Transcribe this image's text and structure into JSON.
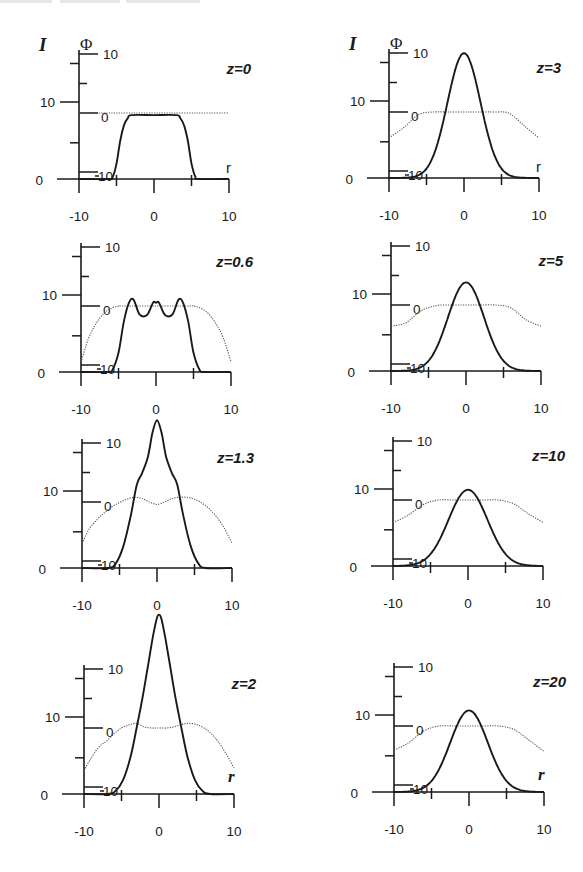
{
  "figure": {
    "header_fragment": "",
    "intensity_symbol": "I",
    "phase_symbol": "Φ",
    "r_symbol": "r"
  },
  "chart_data": [
    {
      "type": "line",
      "title": "z=0",
      "xlabel": "r",
      "ylabel": "I (solid), Φ (dotted)",
      "xlim": [
        -10,
        10
      ],
      "ylim_I": [
        0,
        18
      ],
      "phi_ticks": [
        10,
        0,
        -10
      ],
      "I_ticks": [
        0,
        10
      ],
      "x_ticks": [
        -10,
        0,
        10
      ],
      "series": [
        {
          "name": "I",
          "x": [
            -10,
            -6,
            -5.5,
            -5,
            -4.5,
            -4,
            -3.5,
            -3,
            0,
            3,
            3.5,
            4,
            4.5,
            5,
            5.5,
            6,
            10
          ],
          "values": [
            0,
            0,
            0.3,
            2,
            5,
            7,
            7.9,
            8.3,
            8.3,
            8.3,
            7.9,
            7,
            5,
            2,
            0.3,
            0,
            0
          ]
        },
        {
          "name": "Φ",
          "x": [
            -10,
            10
          ],
          "values": [
            0,
            0
          ]
        }
      ]
    },
    {
      "type": "line",
      "title": "z=3",
      "xlabel": "r",
      "xlim": [
        -10,
        10
      ],
      "phi_ticks": [
        10,
        0,
        -10
      ],
      "I_ticks": [
        0,
        10
      ],
      "x_ticks": [
        -10,
        0,
        10
      ],
      "series": [
        {
          "name": "I",
          "gaussian": {
            "peak": 16.2,
            "center": 0,
            "sigma": 2.2
          }
        },
        {
          "name": "Φ",
          "x": [
            -10,
            -8,
            -6,
            -4,
            -2,
            0,
            2,
            4,
            6,
            8,
            10
          ],
          "values": [
            -4.4,
            -2.6,
            -0.4,
            0,
            0,
            0,
            0,
            0,
            -0.2,
            -2.3,
            -4.4
          ]
        }
      ]
    },
    {
      "type": "line",
      "title": "z=0.6",
      "xlabel": "r",
      "xlim": [
        -10,
        10
      ],
      "phi_ticks": [
        10,
        0,
        -10
      ],
      "I_ticks": [
        0,
        10
      ],
      "x_ticks": [
        -10,
        0,
        10
      ],
      "series": [
        {
          "name": "I",
          "x": [
            -10,
            -6.5,
            -5.8,
            -5,
            -4.3,
            -3.6,
            -3,
            -2.2,
            -1.2,
            -0.4,
            0,
            0.4,
            1.2,
            2.2,
            3,
            3.6,
            4.3,
            5,
            5.8,
            6.5,
            10
          ],
          "values": [
            0,
            0,
            0.3,
            2.5,
            6.5,
            9.0,
            9.4,
            7.5,
            7.4,
            9.0,
            9.0,
            9.0,
            7.4,
            7.5,
            9.4,
            9.0,
            6.5,
            2.5,
            0.3,
            0,
            0
          ]
        },
        {
          "name": "Φ",
          "x": [
            -10,
            -9,
            -8,
            -7,
            -6,
            -5,
            -4,
            4,
            5,
            6,
            7,
            8,
            9,
            10
          ],
          "values": [
            -9.5,
            -5.5,
            -3,
            -1.3,
            -0.4,
            0,
            0,
            0,
            0,
            -0.4,
            -1.3,
            -3,
            -5.5,
            -9.5
          ]
        }
      ]
    },
    {
      "type": "line",
      "title": "z=5",
      "xlabel": "r",
      "xlim": [
        -10,
        10
      ],
      "phi_ticks": [
        10,
        0,
        -10
      ],
      "I_ticks": [
        0,
        10
      ],
      "x_ticks": [
        -10,
        0,
        10
      ],
      "series": [
        {
          "name": "I",
          "gaussian": {
            "peak": 11.5,
            "center": 0,
            "sigma": 2.4
          }
        },
        {
          "name": "Φ",
          "x": [
            -10,
            -8,
            -6,
            -4,
            -2,
            0,
            2,
            4,
            6,
            8,
            10
          ],
          "values": [
            -3.6,
            -3,
            -1,
            -0.1,
            0,
            0,
            0,
            0,
            -0.5,
            -2.5,
            -3.6
          ]
        }
      ]
    },
    {
      "type": "line",
      "title": "z=1.3",
      "xlabel": "r",
      "xlim": [
        -10,
        10
      ],
      "phi_ticks": [
        10,
        0,
        -10
      ],
      "I_ticks": [
        0,
        10
      ],
      "x_ticks": [
        -10,
        0,
        10
      ],
      "series": [
        {
          "name": "I",
          "x": [
            -10,
            -6.5,
            -5.5,
            -4.5,
            -3.5,
            -2.7,
            -2,
            -1.2,
            -0.6,
            0,
            0.6,
            1.2,
            2,
            2.7,
            3.5,
            4.5,
            5.5,
            6.5,
            10
          ],
          "values": [
            0,
            0,
            0.6,
            2.8,
            6.8,
            10.8,
            12.3,
            14.5,
            17.6,
            19.2,
            17.6,
            14.5,
            12.3,
            10.8,
            6.8,
            2.8,
            0.6,
            0,
            0
          ]
        },
        {
          "name": "Φ",
          "x": [
            -10,
            -9,
            -8,
            -7,
            -6,
            -5,
            -4,
            -3,
            -2,
            -1,
            0,
            1,
            2,
            3,
            4,
            5,
            6,
            7,
            8,
            9,
            10
          ],
          "values": [
            -7,
            -4.5,
            -3,
            -1.8,
            -0.8,
            -0.1,
            0.5,
            0.8,
            0.6,
            0,
            -0.4,
            0,
            0.6,
            0.8,
            0.8,
            0.5,
            -0.2,
            -1.2,
            -2.6,
            -4.5,
            -7
          ]
        }
      ]
    },
    {
      "type": "line",
      "title": "z=10",
      "xlabel": "r",
      "xlim": [
        -10,
        10
      ],
      "phi_ticks": [
        10,
        0,
        -10
      ],
      "I_ticks": [
        0,
        10
      ],
      "x_ticks": [
        -10,
        0,
        10
      ],
      "series": [
        {
          "name": "I",
          "gaussian": {
            "peak": 9.9,
            "center": 0,
            "sigma": 2.6
          }
        },
        {
          "name": "Φ",
          "x": [
            -10,
            -8,
            -6,
            -4,
            -2,
            0,
            2,
            4,
            6,
            8,
            10
          ],
          "values": [
            -3.8,
            -2.6,
            -0.8,
            0,
            0,
            0,
            0,
            0,
            -0.6,
            -2.3,
            -3.8
          ]
        }
      ]
    },
    {
      "type": "line",
      "title": "z=2",
      "xlabel": "r",
      "xlim": [
        -10,
        10
      ],
      "phi_ticks": [
        10,
        0,
        -10
      ],
      "I_ticks": [
        0,
        10
      ],
      "x_ticks": [
        -10,
        0,
        10
      ],
      "series": [
        {
          "name": "I",
          "x": [
            -10,
            -6.8,
            -5.8,
            -4.8,
            -3.8,
            -3,
            -2.2,
            -1.5,
            -0.8,
            -0.3,
            0,
            0.3,
            0.8,
            1.5,
            2.2,
            3,
            3.8,
            4.8,
            5.8,
            6.8,
            10
          ],
          "values": [
            0,
            0,
            0.4,
            1.8,
            4.8,
            8.5,
            12.5,
            16.5,
            20.5,
            22.8,
            23.3,
            22.8,
            20.5,
            16.5,
            12.5,
            8.5,
            4.8,
            1.8,
            0.4,
            0,
            0
          ]
        },
        {
          "name": "Φ",
          "x": [
            -10,
            -9,
            -8,
            -7,
            -6,
            -5,
            -4,
            -3,
            -2,
            -1,
            0,
            1,
            2,
            3,
            4,
            5,
            6,
            7,
            8,
            9,
            10
          ],
          "values": [
            -7.2,
            -5,
            -3.2,
            -2.2,
            -1,
            0,
            0.5,
            0.8,
            0.2,
            0,
            0,
            0,
            0.2,
            0.6,
            0.8,
            0.6,
            0,
            -1,
            -2.5,
            -4.5,
            -6.8
          ]
        }
      ]
    },
    {
      "type": "line",
      "title": "z=20",
      "xlabel": "r",
      "xlim": [
        -10,
        10
      ],
      "phi_ticks": [
        10,
        0,
        -10
      ],
      "I_ticks": [
        0,
        10
      ],
      "x_ticks": [
        -10,
        0,
        10
      ],
      "series": [
        {
          "name": "I",
          "gaussian": {
            "peak": 10.6,
            "center": 0,
            "sigma": 2.5
          }
        },
        {
          "name": "Φ",
          "x": [
            -10,
            -8,
            -6,
            -4,
            -2,
            0,
            2,
            4,
            6,
            8,
            10
          ],
          "values": [
            -4.1,
            -2.8,
            -0.8,
            0,
            0,
            0,
            0,
            0,
            -0.6,
            -2.4,
            -4.3
          ]
        }
      ]
    }
  ],
  "panels": [
    {
      "z_label": "z=0",
      "ox": 79,
      "oy": 179,
      "show_sym": true,
      "r_italic": false
    },
    {
      "z_label": "z=3",
      "ox": 389,
      "oy": 178,
      "show_sym": true,
      "r_italic": false
    },
    {
      "z_label": "z=0.6",
      "ox": 81,
      "oy": 372,
      "show_sym": false,
      "r_italic": null
    },
    {
      "z_label": "z=5",
      "ox": 391,
      "oy": 371,
      "show_sym": false,
      "r_italic": null
    },
    {
      "z_label": "z=1.3",
      "ox": 82,
      "oy": 568,
      "show_sym": false,
      "r_italic": null
    },
    {
      "z_label": "z=10",
      "ox": 393,
      "oy": 566,
      "show_sym": false,
      "r_italic": null
    },
    {
      "z_label": "z=2",
      "ox": 84,
      "oy": 794,
      "show_sym": false,
      "r_italic": true
    },
    {
      "z_label": "z=20",
      "ox": 394,
      "oy": 792,
      "show_sym": false,
      "r_italic": true
    }
  ],
  "tick_labels": {
    "phi_top": "10",
    "phi_mid": "0",
    "phi_bottom": "-10",
    "I_ten": "10",
    "I_zero": "0",
    "x_left": "-10",
    "x_mid": "0",
    "x_right": "10"
  }
}
